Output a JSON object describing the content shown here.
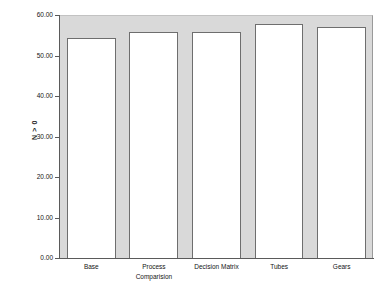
{
  "chart_data": {
    "type": "bar",
    "title": "",
    "subtitle": "",
    "xlabel": "",
    "ylabel": "N > 0",
    "ylim": [
      0,
      60
    ],
    "grid": false,
    "legend": null,
    "categories": [
      "Base",
      "Process Comparision",
      "Decision Matrix",
      "Tubes",
      "Gears"
    ],
    "category_lines": [
      [
        "Base"
      ],
      [
        "Process",
        "Comparision"
      ],
      [
        "Decision Matrix"
      ],
      [
        "Tubes"
      ],
      [
        "Gears"
      ]
    ],
    "values": [
      54.3,
      55.8,
      55.9,
      57.7,
      57.1
    ],
    "ytick_values": [
      0,
      10,
      20,
      30,
      40,
      50,
      60
    ],
    "ytick_labels": [
      "0.00",
      "10.00",
      "20.00",
      "30.00",
      "40.00",
      "50.00",
      "60.00"
    ],
    "colors": {
      "panel_background": "#d9d9d9",
      "bar_fill": "#ffffff",
      "bar_outline": "#6e6e6e",
      "axis": "#5a5a5a",
      "text": "#141414",
      "page_background": "#ffffff"
    }
  }
}
